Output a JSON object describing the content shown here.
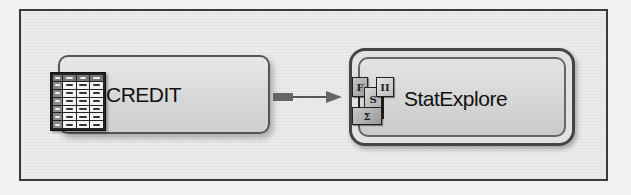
{
  "diagram": {
    "type": "process-flow",
    "nodes": [
      {
        "id": "credit",
        "label": "CREDIT",
        "icon": "data-table-icon",
        "style": "single-border"
      },
      {
        "id": "statexplore",
        "label": "StatExplore",
        "icon": "stat-explore-icon",
        "style": "double-border-selected",
        "icon_glyphs": [
          "F",
          "S",
          "II",
          "Σ"
        ]
      }
    ],
    "edges": [
      {
        "from": "credit",
        "to": "statexplore",
        "arrow": "right"
      }
    ]
  },
  "colors": {
    "canvas": "#ececec",
    "frame_border": "#3a3a3a",
    "node_fill": "#d8d8d8",
    "node_border": "#555555",
    "connector": "#666666"
  }
}
